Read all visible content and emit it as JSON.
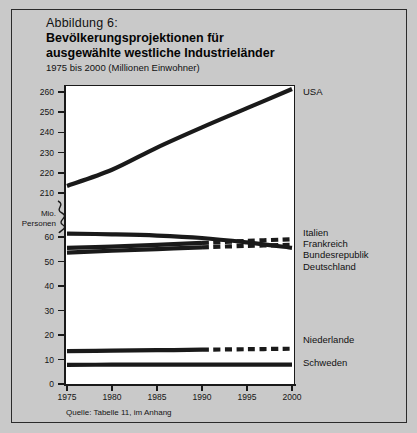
{
  "figure": {
    "label": "Abbildung 6:",
    "title_line1": "Bevölkerungsprojektionen für",
    "title_line2": "ausgewählte westliche Industrieländer",
    "subtitle": "1975 bis 2000 (Millionen Einwohner)",
    "source": "Quelle: Tabelle 11, im Anhang",
    "axis_name_line1": "Mio.",
    "axis_name_line2": "Personen",
    "background_color": "#c9c9c9",
    "plot_background_color": "#ffffff",
    "line_color": "#1a1a1a"
  },
  "chart_data": {
    "type": "line",
    "title": "Bevölkerungsprojektionen für ausgewählte westliche Industrieländer",
    "subtitle": "1975 bis 2000 (Millionen Einwohner)",
    "xlabel": "",
    "ylabel": "Mio. Personen",
    "x": [
      1975,
      1980,
      1985,
      1990,
      1995,
      2000
    ],
    "xlim": [
      1975,
      2000
    ],
    "xticks": [
      1975,
      1980,
      1985,
      1990,
      1995,
      2000
    ],
    "xticklabels": [
      "1975",
      "1980",
      "1985",
      "1990",
      "1995",
      "2000"
    ],
    "yticks_upper": [
      210,
      220,
      230,
      240,
      250,
      260
    ],
    "yticklabels_upper": [
      "210",
      "220",
      "230",
      "240",
      "250",
      "260"
    ],
    "yticks_lower": [
      0,
      10,
      20,
      30,
      40,
      50,
      60
    ],
    "yticklabels_lower": [
      "0",
      "10",
      "20",
      "30",
      "40",
      "50",
      "60"
    ],
    "axis_break": true,
    "axis_break_between": [
      60,
      210
    ],
    "grid": false,
    "legend_position": "right-of-axes",
    "projection_starts": 1990,
    "projection_style": "dashed",
    "series": [
      {
        "name": "USA",
        "values": [
          214.0,
          222.0,
          233.0,
          243.0,
          252.5,
          262.0
        ],
        "scale": "upper",
        "dashed_from": null
      },
      {
        "name": "Bundesrepublik Deutschland",
        "values": [
          61.8,
          61.5,
          61.0,
          60.0,
          58.2,
          56.0
        ],
        "scale": "lower",
        "dashed_from": null
      },
      {
        "name": "Frankreich",
        "values": [
          56.0,
          56.5,
          57.2,
          58.0,
          58.8,
          59.5
        ],
        "scale": "lower",
        "dashed_from": 1990
      },
      {
        "name": "Italien",
        "values": [
          54.0,
          54.8,
          55.5,
          56.2,
          56.8,
          57.2
        ],
        "scale": "lower",
        "dashed_from": 1990
      },
      {
        "name": "Niederlande",
        "values": [
          13.8,
          14.0,
          14.2,
          14.4,
          14.6,
          14.8
        ],
        "scale": "lower",
        "dashed_from": 1990
      },
      {
        "name": "Schweden",
        "values": [
          8.2,
          8.3,
          8.3,
          8.3,
          8.3,
          8.3
        ],
        "scale": "lower",
        "dashed_from": null
      }
    ],
    "annotations": [
      {
        "text": "USA",
        "for": "USA"
      },
      {
        "text": "Italien",
        "for": "Italien"
      },
      {
        "text": "Frankreich",
        "for": "Frankreich"
      },
      {
        "text": "Bundesrepublik",
        "for": "Bundesrepublik Deutschland"
      },
      {
        "text": "Deutschland",
        "for": "Bundesrepublik Deutschland"
      },
      {
        "text": "Niederlande",
        "for": "Niederlande"
      },
      {
        "text": "Schweden",
        "for": "Schweden"
      }
    ]
  }
}
